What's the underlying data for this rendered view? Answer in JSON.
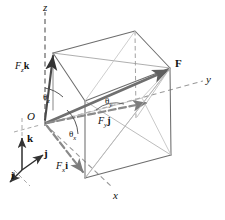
{
  "figure": {
    "width": 225,
    "height": 220,
    "background": "#ffffff",
    "line_color": "#6b6b6b",
    "dash_color": "#8a8a8a",
    "vector_color": "#7a7a7a",
    "text_color": "#111111"
  },
  "axes": [
    {
      "id": "z",
      "label": "z",
      "style": "dashed",
      "label_x": 43,
      "label_y": 3
    },
    {
      "id": "y",
      "label": "y",
      "style": "dashed",
      "label_x": 206,
      "label_y": 76
    },
    {
      "id": "x",
      "label": "x",
      "style": "dashed",
      "label_x": 113,
      "label_y": 192
    }
  ],
  "points": [
    {
      "id": "origin",
      "label": "O",
      "label_x": 28,
      "label_y": 113
    },
    {
      "id": "force-tip",
      "label": "F",
      "label_x": 174,
      "label_y": 60
    }
  ],
  "components": [
    {
      "id": "fz",
      "label_html": "<i>F</i><sub>z</sub><b>k</b>",
      "text": "Fzk",
      "label_x": 16,
      "label_y": 63
    },
    {
      "id": "fy",
      "label_html": "<i>F</i><sub>y</sub><b>j</b>",
      "text": "Fyj",
      "label_x": 98,
      "label_y": 118
    },
    {
      "id": "fx",
      "label_html": "<i>F</i><sub>x</sub><b>i</b>",
      "text": "Fxi",
      "label_x": 57,
      "label_y": 163
    }
  ],
  "angles": [
    {
      "id": "theta-z",
      "label_html": "&#952;<sub>z</sub>",
      "text": "theta-z",
      "label_x": 44,
      "label_y": 95
    },
    {
      "id": "theta-y",
      "label_html": "&#952;<sub>y</sub>",
      "text": "theta-y",
      "label_x": 106,
      "label_y": 99
    },
    {
      "id": "theta-x",
      "label_html": "&#952;<sub>x</sub>",
      "text": "theta-x",
      "label_x": 70,
      "label_y": 132
    }
  ],
  "unit_vectors": [
    {
      "id": "k",
      "label": "k",
      "label_x": 19,
      "label_y": 140
    },
    {
      "id": "j",
      "label": "j",
      "label_x": 30,
      "label_y": 155
    },
    {
      "id": "i",
      "label": "i",
      "label_x": 12,
      "label_y": 172
    }
  ],
  "chart_data": {
    "type": "diagram",
    "elements": [
      "dashed z-axis upward from origin",
      "dashed y-axis to the right from origin",
      "dashed x-axis toward lower-right from origin",
      "rectangular parallelepiped (box) with diagonal F from origin corner to opposite corner",
      "component vector Fz k along z",
      "component vector Fy j along y",
      "component vector Fx i along x",
      "direction angles theta-x, theta-y, theta-z between F and each axis",
      "unit vector triad i, j, k at lower left"
    ]
  }
}
